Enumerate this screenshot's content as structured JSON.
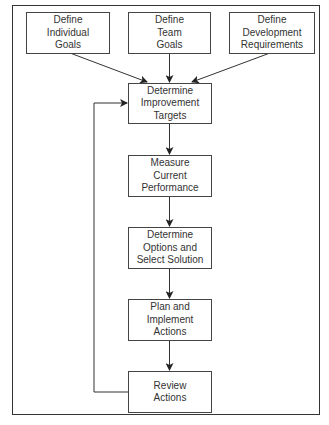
{
  "diagram": {
    "type": "flowchart",
    "inputs": [
      {
        "id": "individual",
        "lines": [
          "Define",
          "Individual",
          "Goals"
        ]
      },
      {
        "id": "team",
        "lines": [
          "Define",
          "Team",
          "Goals"
        ]
      },
      {
        "id": "development",
        "lines": [
          "Define",
          "Development",
          "Requirements"
        ]
      }
    ],
    "steps": [
      {
        "id": "targets",
        "lines": [
          "Determine",
          "Improvement",
          "Targets"
        ]
      },
      {
        "id": "measure",
        "lines": [
          "Measure",
          "Current",
          "Performance"
        ]
      },
      {
        "id": "options",
        "lines": [
          "Determine",
          "Options and",
          "Select Solution"
        ]
      },
      {
        "id": "plan",
        "lines": [
          "Plan and",
          "Implement",
          "Actions"
        ]
      },
      {
        "id": "review",
        "lines": [
          "Review",
          "Actions"
        ]
      }
    ],
    "edges": [
      [
        "individual",
        "targets"
      ],
      [
        "team",
        "targets"
      ],
      [
        "development",
        "targets"
      ],
      [
        "targets",
        "measure"
      ],
      [
        "measure",
        "options"
      ],
      [
        "options",
        "plan"
      ],
      [
        "plan",
        "review"
      ],
      [
        "review",
        "targets"
      ]
    ],
    "colors": {
      "line": "#333333",
      "box_border": "#444444",
      "text": "#333333",
      "background": "#ffffff"
    }
  }
}
